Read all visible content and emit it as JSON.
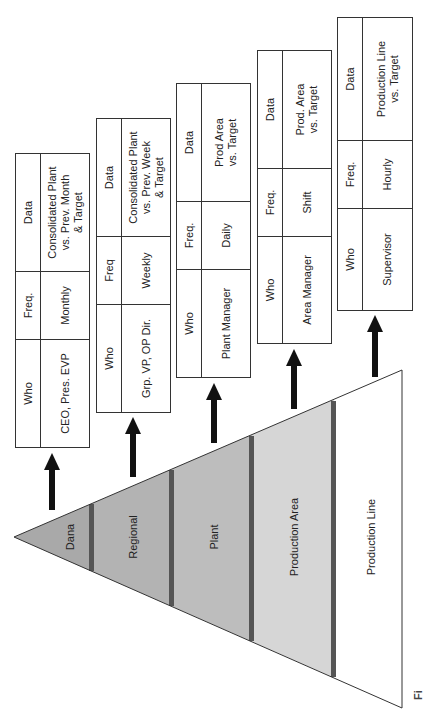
{
  "diagram": {
    "levels": [
      {
        "name": "Dana",
        "color": "#a9a9a9"
      },
      {
        "name": "Regional",
        "color": "#b3b3b3"
      },
      {
        "name": "Plant",
        "color": "#bdbdbd"
      },
      {
        "name": "Production Area",
        "color": "#d6d6d6"
      },
      {
        "name": "Production Line",
        "color": "#ffffff"
      }
    ],
    "divider_color": "#555555",
    "tables": [
      {
        "headers": {
          "who": "Who",
          "freq": "Freq.",
          "data": "Data"
        },
        "who": "CEO, Pres. EVP",
        "freq": "Monthly",
        "data": "Consolidated Plant\nvs. Prev. Month\n& Target"
      },
      {
        "headers": {
          "who": "Who",
          "freq": "Freq",
          "data": "Data"
        },
        "who": "Grp. VP, OP Dir.",
        "freq": "Weekly",
        "data": "Consolidated Plant\nvs. Prev. Week\n& Target"
      },
      {
        "headers": {
          "who": "Who",
          "freq": "Freq.",
          "data": "Data"
        },
        "who": "Plant Manager",
        "freq": "Daily",
        "data": "Prod Area\nvs. Target"
      },
      {
        "headers": {
          "who": "Who",
          "freq": "Freq.",
          "data": "Data"
        },
        "who": "Area Manager",
        "freq": "Shift",
        "data": "Prod. Area\nvs. Target"
      },
      {
        "headers": {
          "who": "Who",
          "freq": "Freq.",
          "data": "Data"
        },
        "who": "Supervisor",
        "freq": "Hourly",
        "data": "Production Line\nvs. Target"
      }
    ],
    "caption": "Fi"
  }
}
